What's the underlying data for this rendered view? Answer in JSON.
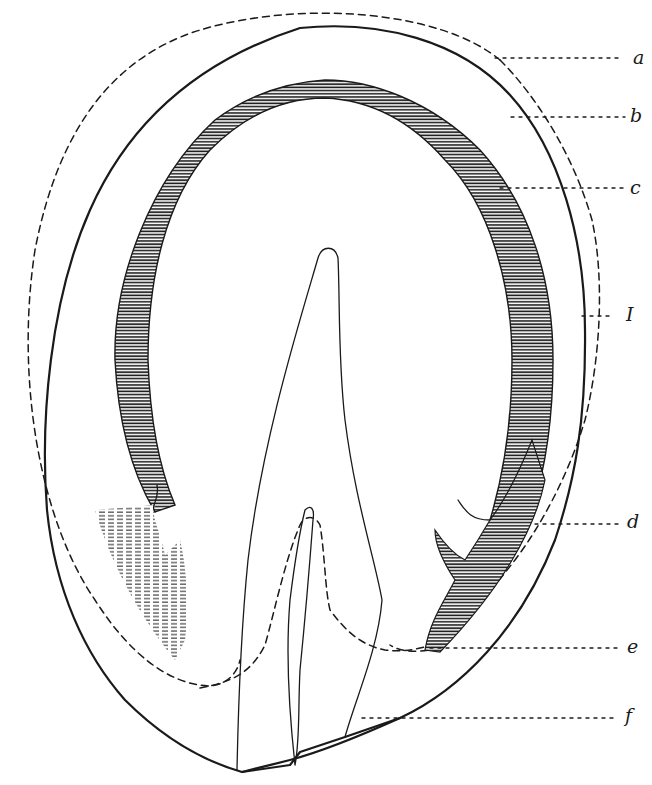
{
  "figure": {
    "type": "anatomical-section-drawing",
    "colors": {
      "ink": "#1a1a1a",
      "background": "#ffffff"
    },
    "labels": [
      {
        "id": "a",
        "text": "a",
        "x": 633,
        "y": 48
      },
      {
        "id": "b",
        "text": "b",
        "x": 630,
        "y": 106
      },
      {
        "id": "c",
        "text": "c",
        "x": 630,
        "y": 178
      },
      {
        "id": "I",
        "text": "I",
        "x": 626,
        "y": 305
      },
      {
        "id": "d",
        "text": "d",
        "x": 627,
        "y": 512
      },
      {
        "id": "e",
        "text": "e",
        "x": 627,
        "y": 637
      },
      {
        "id": "f",
        "text": "f",
        "x": 625,
        "y": 706
      }
    ]
  }
}
